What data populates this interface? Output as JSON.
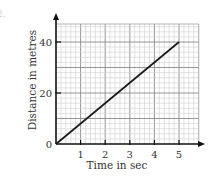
{
  "question_number": "2.",
  "chart_data": {
    "type": "line",
    "title": "",
    "xlabel": "Time in sec",
    "ylabel": "Distance in metres",
    "xlim": [
      0,
      5.8
    ],
    "ylim": [
      0,
      50
    ],
    "x_ticks": [
      1,
      2,
      3,
      4,
      5
    ],
    "y_ticks": [
      0,
      20,
      40
    ],
    "x_tick_labels": [
      "1",
      "2",
      "3",
      "4",
      "5"
    ],
    "y_tick_labels": [
      "0",
      "20",
      "40"
    ],
    "grid": true,
    "series": [
      {
        "name": "distance",
        "x": [
          0,
          5
        ],
        "y": [
          0,
          40
        ],
        "color": "#1a1a1a"
      }
    ]
  }
}
